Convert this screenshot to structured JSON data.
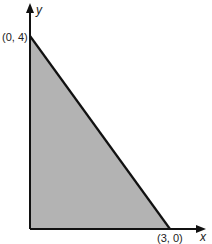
{
  "diagram": {
    "type": "feasible-region",
    "axes": {
      "x_label": "x",
      "y_label": "y"
    },
    "vertices": [
      {
        "label": "(0, 4)",
        "x": 0,
        "y": 4
      },
      {
        "label": "(3, 0)",
        "x": 3,
        "y": 0
      },
      {
        "label": "",
        "x": 0,
        "y": 0
      }
    ],
    "region_fill": "#b3b3b3",
    "line_color": "#111111"
  }
}
